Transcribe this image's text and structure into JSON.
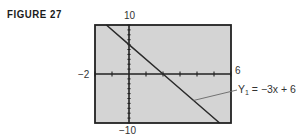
{
  "figure": {
    "label": "FIGURE 27"
  },
  "window": {
    "ymax_label": "10",
    "ymin_label": "−10",
    "xmin_label": "−2",
    "xmax_label": "6"
  },
  "equation": {
    "lhs": "Y",
    "subscript": "1",
    "rhs": " = −3x + 6"
  },
  "colors": {
    "plot_background": "#d4d4d4",
    "frame": "#222222",
    "axis": "#222222",
    "line": "#2a2a2a",
    "leader": "#666666"
  },
  "chart_data": {
    "type": "line",
    "title": "FIGURE 27",
    "xlabel": "",
    "ylabel": "",
    "xlim": [
      -2,
      6
    ],
    "ylim": [
      -10,
      10
    ],
    "x_tick_labels": [
      "-2",
      "6"
    ],
    "y_tick_labels": [
      "-10",
      "10"
    ],
    "x_tick_spacing": 1,
    "y_tick_spacing": 1,
    "grid": false,
    "legend": "none",
    "annotations": [
      {
        "text": "Y1 = -3x + 6",
        "points_to": "line",
        "position": "right"
      }
    ],
    "series": [
      {
        "name": "Y1 = -3x + 6",
        "equation": "y = -3x + 6",
        "x": [
          -1.33,
          0,
          2,
          5.33
        ],
        "y": [
          10,
          6,
          0,
          -10
        ]
      }
    ]
  }
}
